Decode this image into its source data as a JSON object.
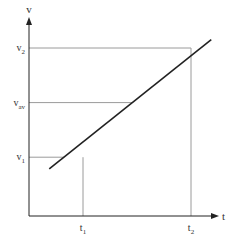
{
  "chart_data": {
    "type": "line",
    "title": "",
    "xlabel": "t",
    "ylabel": "v",
    "grid": false,
    "legend": "none",
    "xlim": [
      0,
      1.22
    ],
    "ylim": [
      0,
      1.0
    ],
    "series": [
      {
        "name": "velocity",
        "x": [
          0.15,
          1.35
        ],
        "y": [
          0.28,
          1.05
        ]
      }
    ],
    "x_markers": [
      {
        "label": "t",
        "sub": "1",
        "value": 0.4
      },
      {
        "label": "t",
        "sub": "2",
        "value": 1.2
      }
    ],
    "y_markers": [
      {
        "label": "v",
        "sub": "1",
        "value": 0.35
      },
      {
        "label": "v",
        "sub": "av",
        "value": 0.675
      },
      {
        "label": "v",
        "sub": "2",
        "value": 1.0
      }
    ],
    "colors": {
      "axis": "#222222",
      "guide": "#9a9a9a",
      "line": "#222222"
    }
  }
}
